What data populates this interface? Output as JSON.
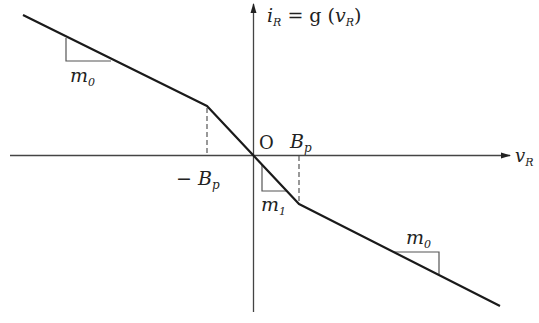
{
  "diagram": {
    "y_axis_label": {
      "main": "i",
      "sub": "R",
      "eq": " = g (",
      "arg": "v",
      "arg_sub": "R",
      "close": ")"
    },
    "x_axis_label": {
      "main": "v",
      "sub": "R"
    },
    "origin_label": "O",
    "breakpoints": {
      "positive": {
        "main": "B",
        "sub": "p"
      },
      "negative": {
        "prefix": "− ",
        "main": "B",
        "sub": "p"
      }
    },
    "slopes": {
      "outer_left": {
        "main": "m",
        "sub": "0"
      },
      "inner": {
        "main": "m",
        "sub": "1"
      },
      "outer_right": {
        "main": "m",
        "sub": "0"
      }
    },
    "colors": {
      "curve": "#1a1a1a",
      "axis": "#333333",
      "guides": "#555555"
    }
  }
}
